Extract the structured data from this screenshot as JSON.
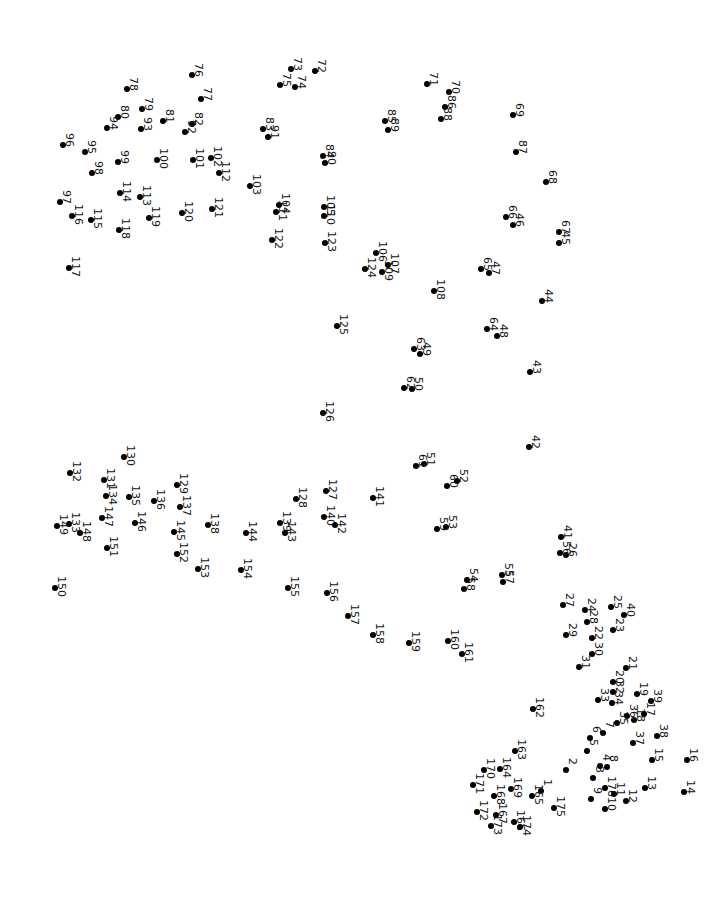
{
  "puzzle": {
    "type": "connect-the-dots",
    "label_rotation_deg": 90,
    "dot_color": "#000000",
    "background": "#ffffff",
    "dots": [
      {
        "n": 1,
        "x": 541,
        "y": 791
      },
      {
        "n": 2,
        "x": 566,
        "y": 770
      },
      {
        "n": 3,
        "x": 593,
        "y": 778
      },
      {
        "n": 4,
        "x": 600,
        "y": 766
      },
      {
        "n": 5,
        "x": 587,
        "y": 751
      },
      {
        "n": 6,
        "x": 590,
        "y": 738
      },
      {
        "n": 7,
        "x": 603,
        "y": 733
      },
      {
        "n": 8,
        "x": 607,
        "y": 767
      },
      {
        "n": 9,
        "x": 591,
        "y": 799
      },
      {
        "n": 10,
        "x": 605,
        "y": 809
      },
      {
        "n": 11,
        "x": 614,
        "y": 794
      },
      {
        "n": 12,
        "x": 626,
        "y": 801
      },
      {
        "n": 13,
        "x": 645,
        "y": 788
      },
      {
        "n": 14,
        "x": 684,
        "y": 792
      },
      {
        "n": 15,
        "x": 652,
        "y": 760
      },
      {
        "n": 16,
        "x": 687,
        "y": 760
      },
      {
        "n": 17,
        "x": 644,
        "y": 714
      },
      {
        "n": 18,
        "x": 634,
        "y": 720
      },
      {
        "n": 19,
        "x": 637,
        "y": 694
      },
      {
        "n": 20,
        "x": 613,
        "y": 682
      },
      {
        "n": 21,
        "x": 626,
        "y": 668
      },
      {
        "n": 22,
        "x": 592,
        "y": 638
      },
      {
        "n": 23,
        "x": 613,
        "y": 630
      },
      {
        "n": 24,
        "x": 585,
        "y": 610
      },
      {
        "n": 25,
        "x": 611,
        "y": 607
      },
      {
        "n": 26,
        "x": 566,
        "y": 555
      },
      {
        "n": 27,
        "x": 563,
        "y": 605
      },
      {
        "n": 28,
        "x": 587,
        "y": 622
      },
      {
        "n": 29,
        "x": 566,
        "y": 635
      },
      {
        "n": 30,
        "x": 592,
        "y": 654
      },
      {
        "n": 31,
        "x": 579,
        "y": 667
      },
      {
        "n": 32,
        "x": 613,
        "y": 692
      },
      {
        "n": 33,
        "x": 598,
        "y": 700
      },
      {
        "n": 34,
        "x": 612,
        "y": 703
      },
      {
        "n": 35,
        "x": 617,
        "y": 723
      },
      {
        "n": 36,
        "x": 627,
        "y": 716
      },
      {
        "n": 37,
        "x": 633,
        "y": 743
      },
      {
        "n": 38,
        "x": 657,
        "y": 736
      },
      {
        "n": 39,
        "x": 651,
        "y": 701
      },
      {
        "n": 40,
        "x": 624,
        "y": 615
      },
      {
        "n": 41,
        "x": 561,
        "y": 537
      },
      {
        "n": 42,
        "x": 529,
        "y": 447
      },
      {
        "n": 43,
        "x": 530,
        "y": 372
      },
      {
        "n": 44,
        "x": 542,
        "y": 301
      },
      {
        "n": 45,
        "x": 559,
        "y": 243
      },
      {
        "n": 46,
        "x": 513,
        "y": 225
      },
      {
        "n": 47,
        "x": 489,
        "y": 273
      },
      {
        "n": 48,
        "x": 497,
        "y": 336
      },
      {
        "n": 49,
        "x": 420,
        "y": 354
      },
      {
        "n": 50,
        "x": 412,
        "y": 389
      },
      {
        "n": 51,
        "x": 424,
        "y": 464
      },
      {
        "n": 52,
        "x": 457,
        "y": 481
      },
      {
        "n": 53,
        "x": 446,
        "y": 527
      },
      {
        "n": 54,
        "x": 467,
        "y": 580
      },
      {
        "n": 55,
        "x": 502,
        "y": 575
      },
      {
        "n": 56,
        "x": 560,
        "y": 553
      },
      {
        "n": 57,
        "x": 503,
        "y": 582
      },
      {
        "n": 58,
        "x": 464,
        "y": 589
      },
      {
        "n": 59,
        "x": 437,
        "y": 529
      },
      {
        "n": 60,
        "x": 447,
        "y": 486
      },
      {
        "n": 61,
        "x": 416,
        "y": 466
      },
      {
        "n": 62,
        "x": 404,
        "y": 388
      },
      {
        "n": 63,
        "x": 414,
        "y": 349
      },
      {
        "n": 64,
        "x": 487,
        "y": 329
      },
      {
        "n": 65,
        "x": 481,
        "y": 269
      },
      {
        "n": 66,
        "x": 506,
        "y": 217
      },
      {
        "n": 67,
        "x": 559,
        "y": 232
      },
      {
        "n": 68,
        "x": 546,
        "y": 182
      },
      {
        "n": 69,
        "x": 513,
        "y": 115
      },
      {
        "n": 70,
        "x": 449,
        "y": 92
      },
      {
        "n": 71,
        "x": 427,
        "y": 84
      },
      {
        "n": 72,
        "x": 315,
        "y": 71
      },
      {
        "n": 73,
        "x": 291,
        "y": 69
      },
      {
        "n": 74,
        "x": 295,
        "y": 87
      },
      {
        "n": 75,
        "x": 280,
        "y": 85
      },
      {
        "n": 76,
        "x": 192,
        "y": 75
      },
      {
        "n": 77,
        "x": 201,
        "y": 99
      },
      {
        "n": 78,
        "x": 127,
        "y": 89
      },
      {
        "n": 79,
        "x": 142,
        "y": 109
      },
      {
        "n": 80,
        "x": 118,
        "y": 117
      },
      {
        "n": 81,
        "x": 163,
        "y": 121
      },
      {
        "n": 82,
        "x": 192,
        "y": 124
      },
      {
        "n": 83,
        "x": 263,
        "y": 129
      },
      {
        "n": 84,
        "x": 323,
        "y": 156
      },
      {
        "n": 85,
        "x": 385,
        "y": 121
      },
      {
        "n": 86,
        "x": 445,
        "y": 107
      },
      {
        "n": 87,
        "x": 516,
        "y": 152
      },
      {
        "n": 88,
        "x": 441,
        "y": 119
      },
      {
        "n": 89,
        "x": 388,
        "y": 130
      },
      {
        "n": 90,
        "x": 325,
        "y": 163
      },
      {
        "n": 91,
        "x": 268,
        "y": 137
      },
      {
        "n": 92,
        "x": 185,
        "y": 132
      },
      {
        "n": 93,
        "x": 141,
        "y": 129
      },
      {
        "n": 94,
        "x": 107,
        "y": 128
      },
      {
        "n": 95,
        "x": 85,
        "y": 152
      },
      {
        "n": 96,
        "x": 63,
        "y": 145
      },
      {
        "n": 97,
        "x": 60,
        "y": 202
      },
      {
        "n": 98,
        "x": 92,
        "y": 173
      },
      {
        "n": 99,
        "x": 118,
        "y": 162
      },
      {
        "n": 100,
        "x": 157,
        "y": 160
      },
      {
        "n": 101,
        "x": 193,
        "y": 160
      },
      {
        "n": 102,
        "x": 211,
        "y": 158
      },
      {
        "n": 103,
        "x": 250,
        "y": 186
      },
      {
        "n": 104,
        "x": 279,
        "y": 205
      },
      {
        "n": 105,
        "x": 324,
        "y": 207
      },
      {
        "n": 106,
        "x": 376,
        "y": 253
      },
      {
        "n": 107,
        "x": 388,
        "y": 265
      },
      {
        "n": 108,
        "x": 434,
        "y": 291
      },
      {
        "n": 109,
        "x": 382,
        "y": 272
      },
      {
        "n": 110,
        "x": 324,
        "y": 216
      },
      {
        "n": 111,
        "x": 276,
        "y": 212
      },
      {
        "n": 112,
        "x": 219,
        "y": 173
      },
      {
        "n": 113,
        "x": 140,
        "y": 197
      },
      {
        "n": 114,
        "x": 120,
        "y": 193
      },
      {
        "n": 115,
        "x": 91,
        "y": 220
      },
      {
        "n": 116,
        "x": 72,
        "y": 216
      },
      {
        "n": 117,
        "x": 69,
        "y": 268
      },
      {
        "n": 118,
        "x": 119,
        "y": 230
      },
      {
        "n": 119,
        "x": 149,
        "y": 218
      },
      {
        "n": 120,
        "x": 182,
        "y": 213
      },
      {
        "n": 121,
        "x": 212,
        "y": 209
      },
      {
        "n": 122,
        "x": 272,
        "y": 240
      },
      {
        "n": 123,
        "x": 325,
        "y": 243
      },
      {
        "n": 124,
        "x": 365,
        "y": 269
      },
      {
        "n": 125,
        "x": 337,
        "y": 326
      },
      {
        "n": 126,
        "x": 323,
        "y": 413
      },
      {
        "n": 127,
        "x": 326,
        "y": 491
      },
      {
        "n": 128,
        "x": 296,
        "y": 499
      },
      {
        "n": 129,
        "x": 177,
        "y": 485
      },
      {
        "n": 130,
        "x": 124,
        "y": 457
      },
      {
        "n": 131,
        "x": 104,
        "y": 480
      },
      {
        "n": 132,
        "x": 70,
        "y": 473
      },
      {
        "n": 133,
        "x": 69,
        "y": 524
      },
      {
        "n": 134,
        "x": 106,
        "y": 496
      },
      {
        "n": 135,
        "x": 129,
        "y": 497
      },
      {
        "n": 136,
        "x": 154,
        "y": 501
      },
      {
        "n": 137,
        "x": 180,
        "y": 507
      },
      {
        "n": 138,
        "x": 208,
        "y": 525
      },
      {
        "n": 139,
        "x": 280,
        "y": 523
      },
      {
        "n": 140,
        "x": 324,
        "y": 517
      },
      {
        "n": 141,
        "x": 373,
        "y": 498
      },
      {
        "n": 142,
        "x": 335,
        "y": 525
      },
      {
        "n": 143,
        "x": 285,
        "y": 533
      },
      {
        "n": 144,
        "x": 246,
        "y": 533
      },
      {
        "n": 145,
        "x": 174,
        "y": 532
      },
      {
        "n": 146,
        "x": 135,
        "y": 523
      },
      {
        "n": 147,
        "x": 102,
        "y": 518
      },
      {
        "n": 148,
        "x": 80,
        "y": 533
      },
      {
        "n": 149,
        "x": 57,
        "y": 526
      },
      {
        "n": 150,
        "x": 55,
        "y": 588
      },
      {
        "n": 151,
        "x": 107,
        "y": 548
      },
      {
        "n": 152,
        "x": 177,
        "y": 554
      },
      {
        "n": 153,
        "x": 198,
        "y": 569
      },
      {
        "n": 154,
        "x": 241,
        "y": 570
      },
      {
        "n": 155,
        "x": 288,
        "y": 588
      },
      {
        "n": 156,
        "x": 327,
        "y": 593
      },
      {
        "n": 157,
        "x": 348,
        "y": 616
      },
      {
        "n": 158,
        "x": 373,
        "y": 635
      },
      {
        "n": 159,
        "x": 409,
        "y": 643
      },
      {
        "n": 160,
        "x": 448,
        "y": 641
      },
      {
        "n": 161,
        "x": 462,
        "y": 654
      },
      {
        "n": 162,
        "x": 533,
        "y": 709
      },
      {
        "n": 163,
        "x": 515,
        "y": 751
      },
      {
        "n": 164,
        "x": 500,
        "y": 769
      },
      {
        "n": 165,
        "x": 532,
        "y": 796
      },
      {
        "n": 166,
        "x": 514,
        "y": 822
      },
      {
        "n": 167,
        "x": 496,
        "y": 815
      },
      {
        "n": 168,
        "x": 494,
        "y": 796
      },
      {
        "n": 169,
        "x": 511,
        "y": 789
      },
      {
        "n": 170,
        "x": 484,
        "y": 770
      },
      {
        "n": 171,
        "x": 473,
        "y": 785
      },
      {
        "n": 172,
        "x": 477,
        "y": 812
      },
      {
        "n": 173,
        "x": 491,
        "y": 826
      },
      {
        "n": 174,
        "x": 520,
        "y": 827
      },
      {
        "n": 175,
        "x": 554,
        "y": 808
      },
      {
        "n": 176,
        "x": 605,
        "y": 788
      }
    ]
  }
}
